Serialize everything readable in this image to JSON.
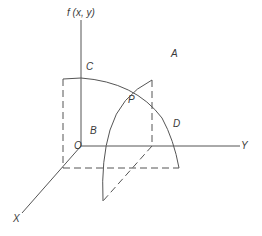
{
  "diagram": {
    "type": "3d-surface-sketch",
    "colors": {
      "line": "#555555",
      "text": "#3a3a3a",
      "background": "#ffffff"
    },
    "axes": {
      "vertical_label": "f (x, y)",
      "x_label": "X",
      "y_label": "Y",
      "origin_label": "O"
    },
    "points": {
      "A": "A",
      "B": "B",
      "C": "C",
      "D": "D",
      "P": "P"
    }
  }
}
